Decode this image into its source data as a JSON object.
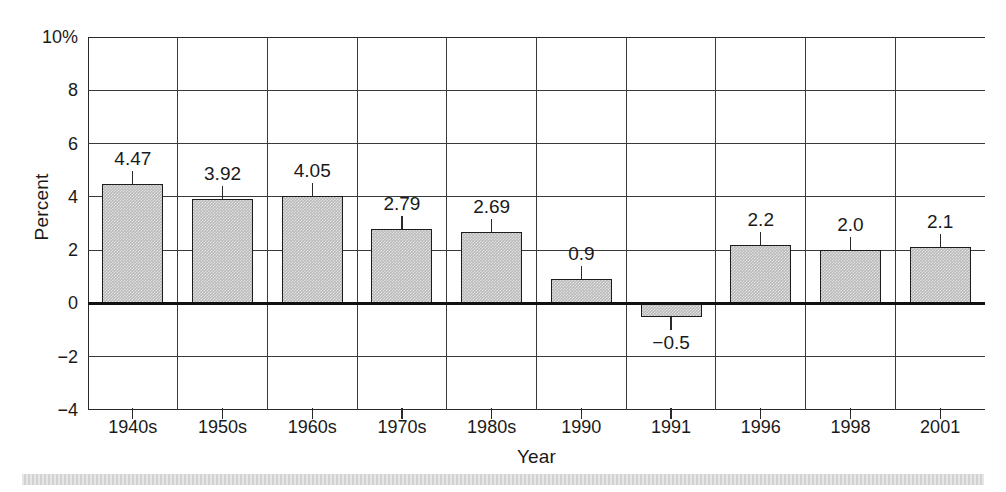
{
  "chart_data": {
    "type": "bar",
    "title": "",
    "xlabel": "Year",
    "ylabel": "Percent",
    "categories": [
      "1940s",
      "1950s",
      "1960s",
      "1970s",
      "1980s",
      "1990",
      "1991",
      "1996",
      "1998",
      "2001"
    ],
    "values": [
      4.47,
      3.92,
      4.05,
      2.79,
      2.69,
      0.9,
      -0.5,
      2.2,
      2.0,
      2.1
    ],
    "value_labels": [
      "4.47",
      "3.92",
      "4.05",
      "2.79",
      "2.69",
      "0.9",
      "−0.5",
      "2.2",
      "2.0",
      "2.1"
    ],
    "ylim": [
      -4,
      10
    ],
    "ytick_values": [
      10,
      8,
      6,
      4,
      2,
      0,
      -2,
      -4
    ],
    "ytick_labels": [
      "10%",
      "8",
      "6",
      "4",
      "2",
      "0",
      "−2",
      "−4"
    ],
    "grid": "both",
    "legend": "none",
    "bar_fill_color": "#b9b9b9",
    "bar_border_color": "#1c1c1c",
    "axis_color": "#2a2a2a",
    "zero_line_color": "#111111"
  },
  "figure": {
    "background_color": "#ffffff",
    "bottom_band_color": "#d2d2d2"
  }
}
